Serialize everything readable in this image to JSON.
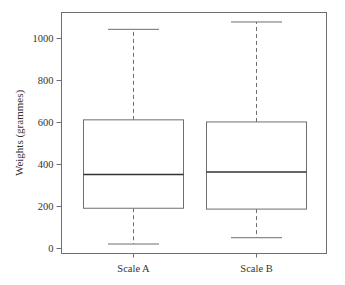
{
  "chart_data": {
    "type": "boxplot",
    "title": "",
    "xlabel": "",
    "ylabel": "Weights (grammes)",
    "ylim": [
      -25,
      1120
    ],
    "yticks": [
      0,
      200,
      400,
      600,
      800,
      1000
    ],
    "ytick_labels": [
      "0",
      "200",
      "400",
      "600",
      "800",
      "1000"
    ],
    "grid": false,
    "legend": null,
    "categories": [
      "Scale A",
      "Scale B"
    ],
    "series": [
      {
        "name": "Scale A",
        "whisker_low": 20,
        "q1": 190,
        "median": 350,
        "q3": 610,
        "whisker_high": 1040
      },
      {
        "name": "Scale B",
        "whisker_low": 50,
        "q1": 186,
        "median": 362,
        "q3": 600,
        "whisker_high": 1075
      }
    ]
  }
}
